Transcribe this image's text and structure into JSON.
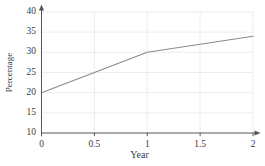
{
  "chart_data": {
    "type": "line",
    "title": "",
    "xlabel": "Year",
    "ylabel": "Percentage",
    "xlim": [
      0,
      2
    ],
    "ylim": [
      10,
      40
    ],
    "xticks": [
      0,
      0.5,
      1,
      1.5,
      2
    ],
    "xtick_labels": [
      "0",
      "0.5",
      "1",
      "1.5",
      "2"
    ],
    "yticks": [
      10,
      15,
      20,
      25,
      30,
      35,
      40
    ],
    "ytick_labels": [
      "10",
      "15",
      "20",
      "25",
      "30",
      "35",
      "40"
    ],
    "grid": true,
    "legend": false,
    "series": [
      {
        "name": "Percentage",
        "color": "#8a8a8a",
        "x": [
          0,
          1,
          2
        ],
        "values": [
          20,
          30,
          34
        ]
      }
    ],
    "axis_style": "arrow-terminated",
    "colors": {
      "line": "#8a8a8a",
      "grid": "#e8e8e8",
      "axis": "#555555",
      "text": "#3a3a3a",
      "background": "#ffffff"
    }
  }
}
